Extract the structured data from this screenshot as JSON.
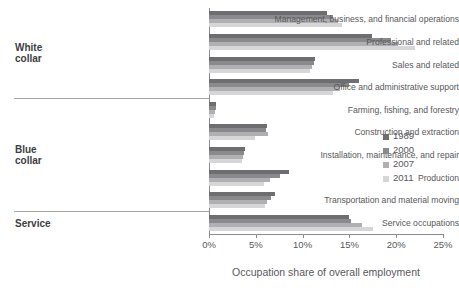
{
  "chart_data": {
    "type": "bar",
    "orientation": "horizontal",
    "title": "",
    "xlabel": "Occupation share of overall employment",
    "ylabel": "",
    "xlim": [
      0,
      25
    ],
    "xunit": "%",
    "xticks": [
      "0%",
      "5%",
      "10%",
      "15%",
      "20%",
      "25%"
    ],
    "xtick_values": [
      0,
      5,
      10,
      15,
      20,
      25
    ],
    "grid": false,
    "legend_position": "right",
    "categories": [
      "Management, business, and financial operations",
      "Professional and related",
      "Sales and related",
      "Office and administrative support",
      "Farming, fishing, and forestry",
      "Construction and extraction",
      "Installation, maintenance, and repair",
      "Production",
      "Transportation and material moving",
      "Service occupations"
    ],
    "groups": [
      {
        "label": "White\ncollar",
        "categories": [
          0,
          1,
          2,
          3
        ]
      },
      {
        "label": "Blue\ncollar",
        "categories": [
          4,
          5,
          6,
          7,
          8
        ]
      },
      {
        "label": "Service",
        "categories": [
          9
        ]
      }
    ],
    "series": [
      {
        "name": "1989",
        "color": "#6e6e70",
        "values": [
          12.6,
          17.4,
          11.3,
          16.0,
          0.8,
          6.2,
          3.8,
          8.6,
          7.0,
          15.0
        ]
      },
      {
        "name": "2000",
        "color": "#8a8a8c",
        "values": [
          13.2,
          19.4,
          11.2,
          15.0,
          0.7,
          6.1,
          3.7,
          7.6,
          6.6,
          15.2
        ]
      },
      {
        "name": "2007",
        "color": "#b0b0b2",
        "values": [
          13.8,
          20.2,
          11.0,
          14.0,
          0.6,
          6.3,
          3.6,
          6.5,
          6.2,
          16.3
        ]
      },
      {
        "name": "2011",
        "color": "#d6d6d8",
        "values": [
          14.2,
          22.0,
          10.8,
          13.2,
          0.5,
          4.9,
          3.5,
          5.9,
          6.0,
          17.5
        ]
      }
    ]
  }
}
